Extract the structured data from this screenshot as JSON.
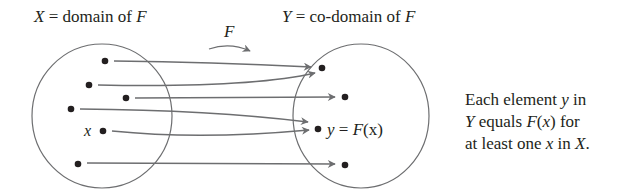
{
  "domain_set": {
    "name": "X",
    "label_var": "X",
    "label_text": " = domain of ",
    "label_func": "F",
    "element_label": "x"
  },
  "codomain_set": {
    "name": "Y",
    "label_var": "Y",
    "label_text": " = co-domain of ",
    "label_func": "F",
    "element_label_y": "y",
    "element_label_eq": " = ",
    "element_label_fx": "F",
    "element_label_paren": "(x)"
  },
  "function_arrow": {
    "label": "F"
  },
  "description": {
    "line1_a": "Each element ",
    "line1_var": "y",
    "line1_b": " in",
    "line2_var": "Y",
    "line2_a": " equals ",
    "line2_f": "F",
    "line2_b": "(",
    "line2_x": "x",
    "line2_c": ") for",
    "line3_a": "at least one ",
    "line3_x": "x",
    "line3_b": " in ",
    "line3_X": "X",
    "line3_c": "."
  },
  "colors": {
    "ink": "#231f20",
    "arrow": "#6d6e70",
    "circle": "#6d6e70"
  },
  "mapping": {
    "domain_points": 6,
    "codomain_points": 4,
    "note": "onto function: every codomain element has at least one preimage"
  }
}
